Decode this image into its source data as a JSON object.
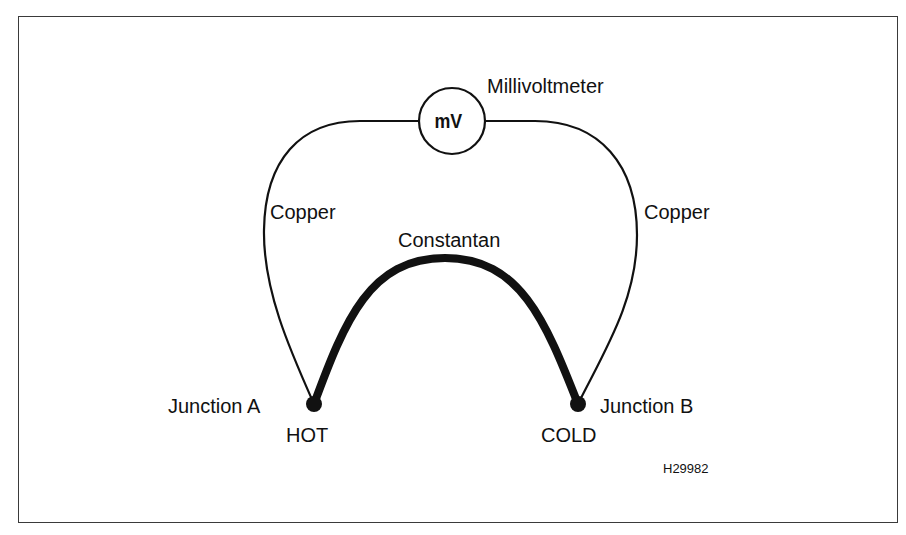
{
  "diagram": {
    "meter": {
      "symbol": "mV",
      "label": "Millivoltmeter"
    },
    "wires": {
      "left_copper": "Copper",
      "right_copper": "Copper",
      "constantan": "Constantan"
    },
    "junctions": {
      "a": {
        "label": "Junction A",
        "state": "HOT"
      },
      "b": {
        "label": "Junction B",
        "state": "COLD"
      }
    },
    "figure_code": "H29982",
    "colors": {
      "line": "#111111",
      "background": "#ffffff",
      "frame": "#3a3a3a"
    }
  }
}
